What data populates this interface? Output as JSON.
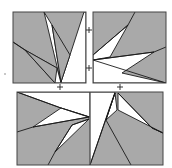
{
  "figure": {
    "title": "",
    "background": "#ffffff",
    "fill_gray": "#a9a9a9",
    "line_color": "#1a1a1a"
  },
  "panels": [
    {
      "id": "top-left",
      "rect": [
        13,
        12,
        73,
        71
      ],
      "white_polygons": [
        "44,12 52,25 61,82 70,55 84,12 86,12 86,83 61,83",
        "13,42 25,50 57,68 61,83 55,83 25,50"
      ],
      "gray_triangles": [
        "52,25 70,55 61,82",
        "25,50 57,68 55,83"
      ]
    },
    {
      "id": "top-right",
      "rect": [
        93,
        12,
        73,
        71
      ],
      "white_polygons": [
        "93,55 128,25 110,57 93,60",
        "93,60 154,52 122,73 166,83 93,83"
      ],
      "lines": [
        "135,12 128,25 93,55",
        "166,47 154,52 93,60",
        "93,60 166,83"
      ]
    },
    {
      "id": "bottom",
      "rect": [
        17,
        92,
        146,
        73
      ],
      "white_polygons": [
        "17,92 90,92 90,117 61,108",
        "33,127 61,108 89,117",
        "89,119 72,125 55,152",
        "90,92 115,92 90,165",
        "115,93 106,120 117,110",
        "118,93 152,128 163,133 118,110"
      ],
      "lines": [
        "17,92 61,108 89,117",
        "17,132 33,127 89,117",
        "89,119 72,125 55,152 48,165",
        "90,165 115,93",
        "115,93 106,120 131,165",
        "118,93 152,128 163,133"
      ],
      "divider_x": 90
    }
  ],
  "marks": {
    "plus_signs": [
      {
        "x": 89,
        "y": 30
      },
      {
        "x": 89,
        "y": 68
      },
      {
        "x": 60,
        "y": 87
      },
      {
        "x": 120,
        "y": 87
      }
    ],
    "dots": [
      {
        "x": 5,
        "y": 74
      }
    ]
  }
}
